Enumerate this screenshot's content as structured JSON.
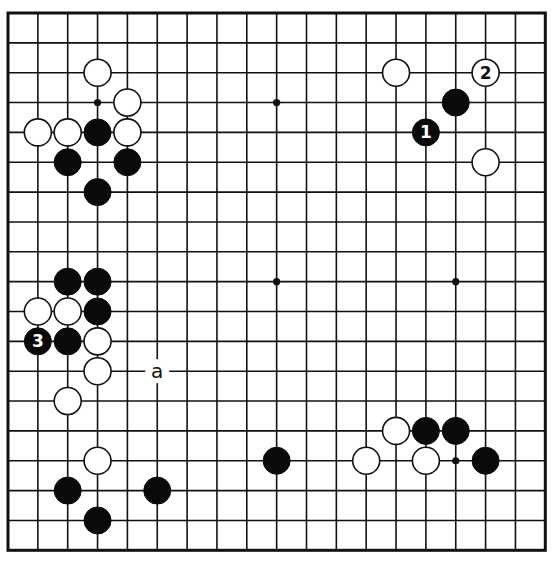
{
  "board": {
    "size": 19,
    "origin_x": 8,
    "origin_y": 13,
    "spacing": 29.85,
    "stone_radius": 13.5,
    "colors": {
      "line": "#111111",
      "black": "#0a0a0a",
      "white": "#ffffff"
    },
    "star_points": [
      [
        3,
        3
      ],
      [
        9,
        3
      ],
      [
        15,
        3
      ],
      [
        3,
        9
      ],
      [
        9,
        9
      ],
      [
        15,
        9
      ],
      [
        3,
        15
      ],
      [
        9,
        15
      ],
      [
        15,
        15
      ]
    ],
    "stones": [
      {
        "color": "white",
        "col": 3,
        "row": 2
      },
      {
        "color": "white",
        "col": 4,
        "row": 3
      },
      {
        "color": "white",
        "col": 1,
        "row": 4
      },
      {
        "color": "white",
        "col": 2,
        "row": 4
      },
      {
        "color": "black",
        "col": 3,
        "row": 4
      },
      {
        "color": "white",
        "col": 4,
        "row": 4
      },
      {
        "color": "black",
        "col": 2,
        "row": 5
      },
      {
        "color": "black",
        "col": 4,
        "row": 5
      },
      {
        "color": "black",
        "col": 3,
        "row": 6
      },
      {
        "color": "black",
        "col": 2,
        "row": 9
      },
      {
        "color": "black",
        "col": 3,
        "row": 9
      },
      {
        "color": "white",
        "col": 1,
        "row": 10
      },
      {
        "color": "white",
        "col": 2,
        "row": 10
      },
      {
        "color": "black",
        "col": 3,
        "row": 10
      },
      {
        "color": "black",
        "col": 1,
        "row": 11,
        "label": "3"
      },
      {
        "color": "black",
        "col": 2,
        "row": 11
      },
      {
        "color": "white",
        "col": 3,
        "row": 11
      },
      {
        "color": "white",
        "col": 3,
        "row": 12
      },
      {
        "color": "white",
        "col": 2,
        "row": 13
      },
      {
        "color": "white",
        "col": 3,
        "row": 15
      },
      {
        "color": "black",
        "col": 2,
        "row": 16
      },
      {
        "color": "black",
        "col": 5,
        "row": 16
      },
      {
        "color": "black",
        "col": 3,
        "row": 17
      },
      {
        "color": "white",
        "col": 13,
        "row": 2
      },
      {
        "color": "white",
        "col": 16,
        "row": 2,
        "label": "2"
      },
      {
        "color": "black",
        "col": 15,
        "row": 3
      },
      {
        "color": "black",
        "col": 14,
        "row": 4,
        "label": "1"
      },
      {
        "color": "white",
        "col": 16,
        "row": 5
      },
      {
        "color": "black",
        "col": 9,
        "row": 15
      },
      {
        "color": "white",
        "col": 13,
        "row": 14
      },
      {
        "color": "black",
        "col": 14,
        "row": 14
      },
      {
        "color": "black",
        "col": 15,
        "row": 14
      },
      {
        "color": "white",
        "col": 12,
        "row": 15
      },
      {
        "color": "white",
        "col": 14,
        "row": 15
      },
      {
        "color": "black",
        "col": 16,
        "row": 15
      }
    ],
    "point_labels": [
      {
        "text": "a",
        "col": 5,
        "row": 12
      }
    ]
  }
}
